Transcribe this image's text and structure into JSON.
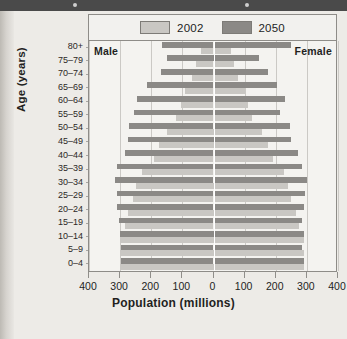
{
  "chart_data": {
    "type": "bar",
    "subtype": "population-pyramid",
    "title": "",
    "xlabel": "Population (millions)",
    "ylabel": "Age (years)",
    "xlim": [
      -400,
      400
    ],
    "xticks": [
      400,
      300,
      200,
      100,
      0,
      100,
      200,
      300,
      400
    ],
    "grid": true,
    "legend_position": "top",
    "side_labels": {
      "left": "Male",
      "right": "Female"
    },
    "categories": [
      "80+",
      "75–79",
      "70–74",
      "65–69",
      "60–64",
      "55–59",
      "50–54",
      "45–49",
      "40–44",
      "35–39",
      "30–34",
      "25–29",
      "20–24",
      "15–19",
      "10–14",
      "5–9",
      "0–4"
    ],
    "series": [
      {
        "name": "2002",
        "color": "#c9c7c3",
        "male": [
          40,
          55,
          70,
          90,
          105,
          120,
          150,
          175,
          190,
          230,
          250,
          260,
          275,
          285,
          300,
          300,
          300
        ],
        "female": [
          55,
          65,
          80,
          100,
          110,
          125,
          155,
          175,
          190,
          225,
          240,
          250,
          265,
          275,
          290,
          290,
          290
        ]
      },
      {
        "name": "2050",
        "color": "#8b8986",
        "male": [
          165,
          150,
          170,
          215,
          245,
          255,
          270,
          275,
          285,
          310,
          315,
          310,
          310,
          305,
          300,
          298,
          298
        ],
        "female": [
          250,
          145,
          175,
          205,
          230,
          215,
          245,
          250,
          270,
          285,
          300,
          295,
          290,
          285,
          290,
          285,
          290
        ]
      }
    ],
    "units": "millions"
  },
  "legend": {
    "items": [
      {
        "label": "2002",
        "swatch": "light-gray-swatch"
      },
      {
        "label": "2050",
        "swatch": "dark-gray-swatch"
      }
    ]
  },
  "axes": {
    "y_title": "Age (years)",
    "x_title": "Population (millions)",
    "x_tick_labels": [
      "400",
      "300",
      "200",
      "100",
      "0",
      "100",
      "200",
      "300",
      "400"
    ],
    "y_tick_labels": [
      "80+",
      "75–79",
      "70–74",
      "65–69",
      "60–64",
      "55–59",
      "50–54",
      "45–49",
      "40–44",
      "35–39",
      "30–34",
      "25–29",
      "20–24",
      "15–19",
      "10–14",
      "5–9",
      "0–4"
    ]
  },
  "plot": {
    "male_label": "Male",
    "female_label": "Female"
  },
  "colors": {
    "series_2002": "#c9c7c3",
    "series_2050": "#8b8986",
    "grid": "#cbc9c5",
    "zero_line": "#ffffff",
    "frame": "#8e8c88",
    "page_background": "#edebe7",
    "header_strip": "#4a4a4a"
  }
}
